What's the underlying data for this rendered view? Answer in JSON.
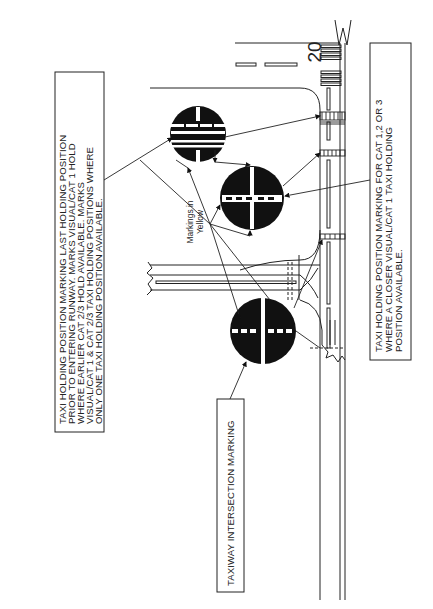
{
  "diagram": {
    "orientation": "rotated 90 degrees counter-clockwise",
    "runway": {
      "designator": "20"
    },
    "annotation": {
      "markings_note": [
        "Markings in",
        "Yellow"
      ]
    },
    "callouts": {
      "last_holding": {
        "lines": [
          "TAXI HOLDING POSITION MARKING LAST HOLDING POSITION",
          "PRIOR TO ENTERING RUNWAY. MARKS VISUAL/CAT 1 HOLD",
          "WHERE EARLIER CAT 2/3 HOLD AVAILABLE. MARKS",
          "VISUAL/CAT 1 & CAT 2/3 TAXI HOLDING POSITIONS WHERE",
          "ONLY ONE TAXI HOLDING POSITION AVAILABLE."
        ]
      },
      "cat_123": {
        "lines": [
          "TAXI HOLDING POSITION MARKING FOR CAT 1,2 OR 3",
          "WHERE A CLOSER VISUAL/CAT 1 TAXI HOLDING",
          "POSITION AVAILABLE."
        ]
      },
      "intersection": {
        "lines": [
          "TAXIWAY INTERSECTION MARKING"
        ]
      }
    },
    "markers": [
      {
        "id": "top",
        "type": "taxi-holding-last"
      },
      {
        "id": "middle",
        "type": "taxi-holding-cat123"
      },
      {
        "id": "bottom",
        "type": "taxiway-intersection"
      }
    ],
    "colors": {
      "ink": "#1a1a1a",
      "paper": "#ffffff"
    }
  }
}
